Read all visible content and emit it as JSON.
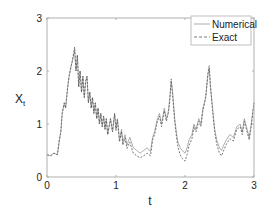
{
  "chart_data": {
    "type": "line",
    "title": "",
    "xlabel": "t",
    "ylabel": "X",
    "ylabel_subscript": "t",
    "xlim": [
      0,
      3
    ],
    "ylim": [
      0,
      3
    ],
    "xticks": [
      0,
      1,
      2,
      3
    ],
    "yticks": [
      0,
      1,
      2,
      3
    ],
    "xtick_labels": [
      "0",
      "1",
      "2",
      "3"
    ],
    "ytick_labels": [
      "0",
      "1",
      "2",
      "3"
    ],
    "grid": false,
    "legend_position": "upper right",
    "series": [
      {
        "name": "Numerical",
        "style": "solid",
        "color": "#9a9a9a",
        "x": [
          0.0,
          0.05,
          0.1,
          0.15,
          0.18,
          0.2,
          0.22,
          0.25,
          0.27,
          0.3,
          0.32,
          0.35,
          0.37,
          0.4,
          0.42,
          0.44,
          0.46,
          0.48,
          0.5,
          0.52,
          0.54,
          0.56,
          0.58,
          0.6,
          0.62,
          0.64,
          0.66,
          0.68,
          0.7,
          0.72,
          0.74,
          0.76,
          0.78,
          0.8,
          0.82,
          0.84,
          0.86,
          0.88,
          0.9,
          0.92,
          0.95,
          0.98,
          1.0,
          1.02,
          1.05,
          1.08,
          1.1,
          1.13,
          1.16,
          1.2,
          1.25,
          1.3,
          1.35,
          1.4,
          1.45,
          1.5,
          1.53,
          1.56,
          1.6,
          1.63,
          1.66,
          1.7,
          1.73,
          1.76,
          1.78,
          1.8,
          1.82,
          1.85,
          1.88,
          1.9,
          1.93,
          1.96,
          2.0,
          2.03,
          2.06,
          2.1,
          2.13,
          2.16,
          2.2,
          2.23,
          2.26,
          2.3,
          2.33,
          2.35,
          2.37,
          2.4,
          2.43,
          2.46,
          2.5,
          2.53,
          2.56,
          2.6,
          2.65,
          2.7,
          2.75,
          2.8,
          2.83,
          2.86,
          2.9,
          2.93,
          2.96,
          3.0
        ],
        "values": [
          0.42,
          0.4,
          0.45,
          0.42,
          0.7,
          0.85,
          1.2,
          1.4,
          1.3,
          1.7,
          1.9,
          2.1,
          2.2,
          2.4,
          2.0,
          2.3,
          1.7,
          2.0,
          1.6,
          1.9,
          1.5,
          1.8,
          1.9,
          1.4,
          1.6,
          1.3,
          1.5,
          1.2,
          1.4,
          1.1,
          1.3,
          1.0,
          1.2,
          0.95,
          1.15,
          0.9,
          1.1,
          0.8,
          0.95,
          1.1,
          0.85,
          1.2,
          0.9,
          1.1,
          0.7,
          0.9,
          0.65,
          0.8,
          0.6,
          0.75,
          0.55,
          0.5,
          0.45,
          0.5,
          0.55,
          0.48,
          0.75,
          0.85,
          1.1,
          1.2,
          1.0,
          1.3,
          1.1,
          1.25,
          1.5,
          1.8,
          1.6,
          1.1,
          0.8,
          0.65,
          0.55,
          0.5,
          0.45,
          0.55,
          0.7,
          0.8,
          1.0,
          0.9,
          1.1,
          1.0,
          1.3,
          1.5,
          1.9,
          2.05,
          1.7,
          1.3,
          0.9,
          0.7,
          0.55,
          0.5,
          0.6,
          0.7,
          0.8,
          0.75,
          0.95,
          1.0,
          0.85,
          1.1,
          0.9,
          0.75,
          1.0,
          1.4
        ]
      },
      {
        "name": "Exact",
        "style": "dashed",
        "color": "#555555",
        "x": [
          0.0,
          0.05,
          0.1,
          0.15,
          0.18,
          0.2,
          0.22,
          0.25,
          0.27,
          0.3,
          0.32,
          0.35,
          0.37,
          0.4,
          0.42,
          0.44,
          0.46,
          0.48,
          0.5,
          0.52,
          0.54,
          0.56,
          0.58,
          0.6,
          0.62,
          0.64,
          0.66,
          0.68,
          0.7,
          0.72,
          0.74,
          0.76,
          0.78,
          0.8,
          0.82,
          0.84,
          0.86,
          0.88,
          0.9,
          0.92,
          0.95,
          0.98,
          1.0,
          1.02,
          1.05,
          1.08,
          1.1,
          1.13,
          1.16,
          1.2,
          1.25,
          1.3,
          1.35,
          1.4,
          1.45,
          1.5,
          1.53,
          1.56,
          1.6,
          1.63,
          1.66,
          1.7,
          1.73,
          1.76,
          1.78,
          1.8,
          1.82,
          1.85,
          1.88,
          1.9,
          1.93,
          1.96,
          2.0,
          2.03,
          2.06,
          2.1,
          2.13,
          2.16,
          2.2,
          2.23,
          2.26,
          2.3,
          2.33,
          2.35,
          2.37,
          2.4,
          2.43,
          2.46,
          2.5,
          2.53,
          2.56,
          2.6,
          2.65,
          2.7,
          2.75,
          2.8,
          2.83,
          2.86,
          2.9,
          2.93,
          2.96,
          3.0
        ],
        "values": [
          0.42,
          0.4,
          0.45,
          0.42,
          0.7,
          0.85,
          1.2,
          1.4,
          1.3,
          1.7,
          1.9,
          2.1,
          2.2,
          2.45,
          2.0,
          2.3,
          1.7,
          2.0,
          1.6,
          1.9,
          1.5,
          1.8,
          1.9,
          1.4,
          1.6,
          1.3,
          1.5,
          1.2,
          1.4,
          1.1,
          1.3,
          1.0,
          1.2,
          0.95,
          1.15,
          0.9,
          1.1,
          0.8,
          0.95,
          1.1,
          0.85,
          1.2,
          0.88,
          1.08,
          0.66,
          0.86,
          0.6,
          0.74,
          0.54,
          0.66,
          0.45,
          0.4,
          0.36,
          0.4,
          0.45,
          0.4,
          0.7,
          0.8,
          1.05,
          1.15,
          0.95,
          1.25,
          1.05,
          1.2,
          1.45,
          1.85,
          1.55,
          1.05,
          0.72,
          0.55,
          0.42,
          0.35,
          0.3,
          0.42,
          0.6,
          0.72,
          0.95,
          0.85,
          1.05,
          0.95,
          1.25,
          1.5,
          1.95,
          2.1,
          1.7,
          1.25,
          0.85,
          0.62,
          0.45,
          0.4,
          0.5,
          0.62,
          0.72,
          0.68,
          0.9,
          0.95,
          0.8,
          1.05,
          0.85,
          0.7,
          0.95,
          1.4
        ]
      }
    ]
  },
  "colors": {
    "axis": "#b0b0b0",
    "text": "#222222",
    "background": "#ffffff"
  }
}
